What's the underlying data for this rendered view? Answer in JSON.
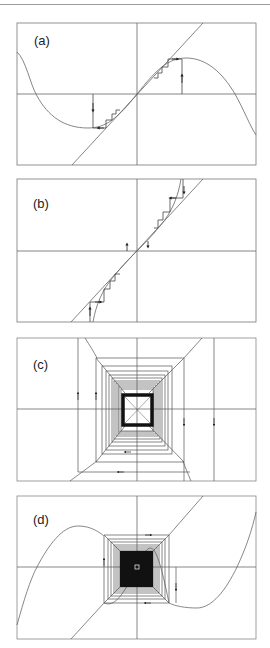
{
  "figure": {
    "panels": [
      {
        "id": "a",
        "label": "(a)",
        "frame": {
          "x": 17,
          "y": 23,
          "w": 239,
          "h": 142
        },
        "axis": {
          "x": 137,
          "y": 94
        },
        "label_pos": {
          "x": 34,
          "y": 33
        },
        "description": "S-shaped cubic map with diagonal; cobweb converging to two side fixed points"
      },
      {
        "id": "b",
        "label": "(b)",
        "frame": {
          "x": 17,
          "y": 179,
          "w": 239,
          "h": 143
        },
        "axis": {
          "x": 137,
          "y": 251
        },
        "label_pos": {
          "x": 33,
          "y": 196
        },
        "description": "Steep map crossing diagonal at origin; cobweb diverging from origin"
      },
      {
        "id": "c",
        "label": "(c)",
        "frame": {
          "x": 17,
          "y": 338,
          "w": 239,
          "h": 143
        },
        "axis": {
          "x": 137,
          "y": 409
        },
        "label_pos": {
          "x": 33,
          "y": 357
        },
        "description": "Square cobweb spiral converging to origin"
      },
      {
        "id": "d",
        "label": "(d)",
        "frame": {
          "x": 17,
          "y": 496,
          "w": 239,
          "h": 143
        },
        "axis": {
          "x": 137,
          "y": 567
        },
        "label_pos": {
          "x": 33,
          "y": 512
        },
        "description": "Cubic map with spiral cobweb converging to origin"
      }
    ],
    "colors": {
      "line": "#555555",
      "frame": "#777777",
      "curve": "#666666",
      "fill": "#111111",
      "rule": "#9a9a9a"
    }
  }
}
